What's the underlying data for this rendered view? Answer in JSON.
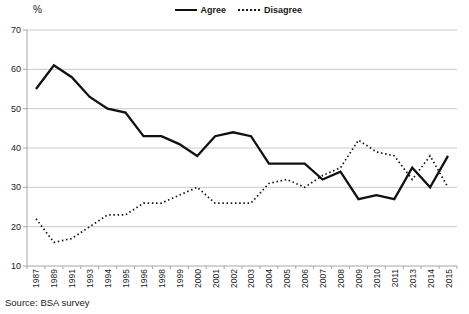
{
  "source": "Source: BSA survey",
  "chart_data": {
    "type": "line",
    "title": "",
    "xlabel": "",
    "ylabel": "%",
    "ylim": [
      10,
      70
    ],
    "ytick_step": 10,
    "grid": true,
    "legend_position": "top-center",
    "categories": [
      "1987",
      "1989",
      "1991",
      "1993",
      "1994",
      "1995",
      "1996",
      "1998",
      "1999",
      "2000",
      "2001",
      "2002",
      "2003",
      "2004",
      "2005",
      "2006",
      "2007",
      "2008",
      "2009",
      "2010",
      "2011",
      "2013",
      "2014",
      "2015"
    ],
    "series": [
      {
        "name": "Agree",
        "style": "solid",
        "color": "#111111",
        "values": [
          55,
          61,
          58,
          53,
          50,
          49,
          43,
          43,
          41,
          38,
          43,
          44,
          43,
          36,
          36,
          36,
          32,
          34,
          27,
          28,
          27,
          35,
          30,
          38
        ]
      },
      {
        "name": "Disagree",
        "style": "dotted",
        "color": "#111111",
        "values": [
          22,
          16,
          17,
          20,
          23,
          23,
          26,
          26,
          28,
          30,
          26,
          26,
          26,
          31,
          32,
          30,
          33,
          35,
          42,
          39,
          38,
          32,
          38,
          30
        ]
      }
    ],
    "colors": {
      "line": "#111111",
      "grid": "#c9c9c9",
      "axis": "#a6a6a6",
      "text": "#1a1a1a"
    }
  }
}
